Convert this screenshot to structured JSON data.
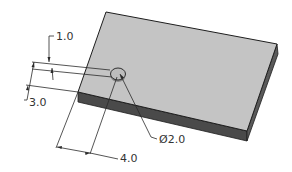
{
  "drawing": {
    "type": "isometric-part-drawing",
    "part": "rectangular plate with through hole",
    "colors": {
      "top_face": "#c4c4c4",
      "front_face": "#4a4a4a",
      "side_face": "#5a5a5a",
      "outline": "#1e1e1e",
      "dimension_lines": "#2a2a2a",
      "text": "#333333"
    },
    "dimensions": {
      "hole_offset_small": {
        "label": "1.0"
      },
      "hole_offset_edge": {
        "label": "3.0"
      },
      "hole_offset_length": {
        "label": "4.0"
      },
      "hole_diameter": {
        "label": "Ø2.0"
      }
    }
  }
}
